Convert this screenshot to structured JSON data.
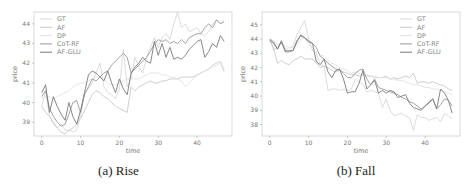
{
  "chart_data": [
    {
      "type": "line",
      "title": "",
      "caption": "(a) Rise",
      "xlabel": "time",
      "ylabel": "price",
      "xlim": [
        -2,
        49
      ],
      "ylim": [
        38.3,
        44.6
      ],
      "xticks": [
        0,
        10,
        20,
        30,
        40
      ],
      "yticks": [
        39,
        40,
        41,
        42,
        43,
        44
      ],
      "grid": false,
      "legend_position": "upper left",
      "x": [
        0,
        1,
        2,
        3,
        4,
        5,
        6,
        7,
        8,
        9,
        10,
        11,
        12,
        13,
        14,
        15,
        16,
        17,
        18,
        19,
        20,
        21,
        22,
        23,
        24,
        25,
        26,
        27,
        28,
        29,
        30,
        31,
        32,
        33,
        34,
        35,
        36,
        37,
        38,
        39,
        40,
        41,
        42,
        43,
        44,
        45,
        46,
        47
      ],
      "series": [
        {
          "name": "GT",
          "color": "#d8d8d8",
          "values": [
            39.8,
            40.6,
            39.3,
            38.9,
            38.7,
            38.9,
            38.6,
            38.6,
            38.5,
            38.6,
            39.4,
            40.5,
            40.7,
            41.0,
            41.5,
            42.0,
            40.8,
            40.5,
            40.4,
            40.2,
            40.7,
            42.7,
            40.8,
            41.2,
            42.3,
            41.8,
            41.5,
            42.3,
            42.8,
            43.3,
            42.8,
            43.3,
            43.5,
            43.2,
            44.0,
            44.6,
            43.8,
            44.0,
            43.6,
            43.7,
            43.8,
            43.5,
            43.4,
            43.6,
            44.0,
            44.2,
            44.0,
            44.2
          ]
        },
        {
          "name": "AF",
          "color": "#c8c8c8",
          "values": [
            39.8,
            39.5,
            39.3,
            39.0,
            38.7,
            38.5,
            38.4,
            38.6,
            38.7,
            38.9,
            39.2,
            39.6,
            40.0,
            40.4,
            40.6,
            40.5,
            40.3,
            40.2,
            40.0,
            39.8,
            39.7,
            39.6,
            39.5,
            40.8,
            40.6,
            40.8,
            40.9,
            41.0,
            41.1,
            41.0,
            41.0,
            41.1,
            41.1,
            41.2,
            41.2,
            41.2,
            41.3,
            41.3,
            41.3,
            41.3,
            41.4,
            41.5,
            41.6,
            41.7,
            41.9,
            42.0,
            42.1,
            41.6
          ]
        },
        {
          "name": "DP",
          "color": "#e2e2e2",
          "values": [
            40.2,
            40.3,
            40.3,
            40.2,
            40.3,
            40.4,
            40.5,
            40.6,
            40.8,
            40.9,
            41.0,
            41.0,
            41.1,
            41.2,
            41.3,
            41.3,
            41.2,
            41.0,
            40.9,
            40.9,
            41.0,
            41.1,
            41.2,
            41.2,
            41.2,
            41.2,
            41.3,
            41.4,
            41.5,
            41.5,
            41.5,
            41.4,
            41.4,
            41.3,
            41.3,
            41.2,
            41.1,
            40.8,
            41.0,
            41.2,
            41.4,
            41.5,
            41.6,
            41.7,
            41.8,
            41.9,
            42.0,
            41.5
          ]
        },
        {
          "name": "CoT-RF",
          "color": "#9a9a9a",
          "values": [
            40.3,
            40.6,
            39.7,
            39.3,
            39.0,
            38.8,
            38.9,
            39.4,
            40.0,
            40.1,
            39.5,
            40.4,
            40.8,
            41.2,
            41.1,
            41.3,
            41.5,
            41.6,
            41.9,
            42.1,
            42.3,
            42.5,
            42.3,
            41.5,
            41.7,
            41.9,
            42.1,
            42.3,
            42.6,
            43.0,
            43.2,
            43.1,
            43.2,
            43.0,
            43.1,
            43.0,
            43.2,
            43.0,
            43.3,
            43.4,
            43.5,
            43.5,
            43.8,
            44.0,
            43.8,
            44.2,
            44.0,
            44.1
          ]
        },
        {
          "name": "AF-GLU",
          "color": "#7a7a7a",
          "values": [
            40.5,
            40.9,
            39.5,
            40.3,
            39.8,
            39.4,
            39.1,
            40.0,
            39.3,
            38.9,
            39.6,
            40.5,
            41.4,
            41.6,
            41.5,
            41.3,
            41.1,
            41.6,
            41.0,
            40.5,
            41.2,
            40.7,
            40.4,
            41.5,
            41.8,
            42.0,
            42.3,
            42.1,
            42.0,
            43.1,
            42.4,
            43.0,
            42.3,
            42.8,
            42.2,
            42.3,
            42.2,
            42.4,
            42.7,
            42.9,
            43.1,
            43.2,
            42.3,
            42.6,
            43.0,
            42.8,
            43.4,
            43.1
          ]
        }
      ]
    },
    {
      "type": "line",
      "title": "",
      "caption": "(b) Fall",
      "xlabel": "time",
      "ylabel": "price",
      "xlim": [
        -2,
        49
      ],
      "ylim": [
        37.2,
        45.9
      ],
      "xticks": [
        0,
        10,
        20,
        30,
        40
      ],
      "yticks": [
        38,
        39,
        40,
        41,
        42,
        43,
        44,
        45
      ],
      "grid": false,
      "legend_position": "upper right",
      "x": [
        0,
        1,
        2,
        3,
        4,
        5,
        6,
        7,
        8,
        9,
        10,
        11,
        12,
        13,
        14,
        15,
        16,
        17,
        18,
        19,
        20,
        21,
        22,
        23,
        24,
        25,
        26,
        27,
        28,
        29,
        30,
        31,
        32,
        33,
        34,
        35,
        36,
        37,
        38,
        39,
        40,
        41,
        42,
        43,
        44,
        45,
        46,
        47
      ],
      "series": [
        {
          "name": "GT",
          "color": "#d8d8d8",
          "values": [
            44.0,
            43.2,
            43.5,
            43.8,
            43.3,
            43.4,
            43.5,
            44.3,
            44.8,
            45.3,
            44.0,
            43.2,
            43.0,
            42.2,
            42.1,
            40.4,
            40.5,
            40.5,
            40.4,
            40.5,
            40.4,
            40.5,
            41.2,
            41.0,
            40.8,
            40.3,
            40.4,
            40.3,
            40.2,
            39.2,
            39.8,
            39.0,
            38.6,
            38.7,
            38.8,
            38.6,
            38.5,
            37.6,
            38.7,
            38.5,
            38.5,
            38.3,
            38.4,
            38.5,
            38.2,
            38.8,
            38.6,
            38.4
          ]
        },
        {
          "name": "AF",
          "color": "#c8c8c8",
          "values": [
            43.9,
            43.4,
            42.3,
            42.5,
            42.3,
            42.2,
            42.5,
            42.6,
            42.8,
            42.6,
            42.6,
            42.6,
            42.3,
            42.0,
            42.1,
            42.0,
            41.8,
            41.7,
            41.8,
            41.7,
            41.6,
            41.5,
            41.5,
            41.4,
            41.5,
            41.4,
            41.4,
            41.3,
            41.3,
            41.3,
            41.4,
            41.2,
            41.3,
            41.2,
            41.3,
            41.4,
            41.3,
            41.6,
            40.9,
            41.0,
            41.0,
            40.9,
            41.0,
            40.9,
            40.8,
            40.7,
            40.5,
            40.4
          ]
        },
        {
          "name": "DP",
          "color": "#e2e2e2",
          "values": [
            44.0,
            43.9,
            43.6,
            43.7,
            43.5,
            43.4,
            43.4,
            43.6,
            44.0,
            44.1,
            43.6,
            43.4,
            43.1,
            42.9,
            42.8,
            42.5,
            42.3,
            42.2,
            42.0,
            41.9,
            41.8,
            41.6,
            41.7,
            41.6,
            41.5,
            41.5,
            41.4,
            41.4,
            41.3,
            41.3,
            41.3,
            41.2,
            41.2,
            41.1,
            41.1,
            41.0,
            40.9,
            40.8,
            40.8,
            40.7,
            40.6,
            40.6,
            40.5,
            40.5,
            40.4,
            40.3,
            40.2,
            40.1
          ]
        },
        {
          "name": "CoT-RF",
          "color": "#9a9a9a",
          "values": [
            44.0,
            43.8,
            43.3,
            43.9,
            43.2,
            43.2,
            43.2,
            43.9,
            44.2,
            44.1,
            43.9,
            43.7,
            43.4,
            42.8,
            42.6,
            42.3,
            42.1,
            41.9,
            41.8,
            41.6,
            41.3,
            41.3,
            41.6,
            41.8,
            41.9,
            41.2,
            40.8,
            41.2,
            40.6,
            40.5,
            40.4,
            40.3,
            40.2,
            40.1,
            39.9,
            39.8,
            39.6,
            39.5,
            39.3,
            39.1,
            39.3,
            39.6,
            39.8,
            39.1,
            39.4,
            39.8,
            39.7,
            39.3
          ]
        },
        {
          "name": "AF-GLU",
          "color": "#7a7a7a",
          "values": [
            43.9,
            43.7,
            43.3,
            43.8,
            43.1,
            43.1,
            43.2,
            43.8,
            44.3,
            44.1,
            43.8,
            43.7,
            42.4,
            42.2,
            42.6,
            41.7,
            41.3,
            41.8,
            41.9,
            41.2,
            40.2,
            40.3,
            40.3,
            40.9,
            41.8,
            40.5,
            40.8,
            41.1,
            40.2,
            40.4,
            40.2,
            40.4,
            40.3,
            39.9,
            40.0,
            40.1,
            39.5,
            39.2,
            39.1,
            39.0,
            39.3,
            39.5,
            39.8,
            39.1,
            40.5,
            40.2,
            39.7,
            38.8
          ]
        }
      ]
    }
  ],
  "panels": [
    {
      "caption": "(a) Rise",
      "xlabel": "time",
      "ylabel": "price"
    },
    {
      "caption": "(b) Fall",
      "xlabel": "time",
      "ylabel": "price"
    }
  ]
}
